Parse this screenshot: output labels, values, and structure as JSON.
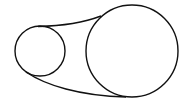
{
  "diagram": {
    "type": "belt-pulley",
    "stroke_color": "#111111",
    "background": "#ffffff",
    "small_pulley": {
      "cx": 40,
      "cy": 51,
      "r": 25
    },
    "large_pulley": {
      "cx": 132,
      "cy": 51,
      "r": 46
    },
    "upper_belt": "M 38 26.5 C 60 26, 80 24, 101 16",
    "lower_belt": "M 26 72 C 45 85, 80 96, 126 97"
  }
}
